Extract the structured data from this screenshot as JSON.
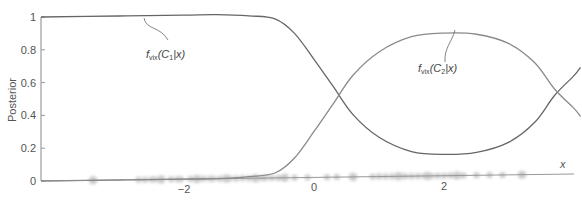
{
  "chart_data": {
    "type": "line",
    "title": "",
    "xlabel": "x",
    "ylabel": "Posterior",
    "xlim": [
      -4.2,
      4.1
    ],
    "ylim": [
      0,
      1
    ],
    "x_ticks": [
      -2,
      0,
      2
    ],
    "x_tick_labels": [
      "−2",
      "0",
      "2"
    ],
    "y_ticks": [
      0,
      0.2,
      0.4,
      0.6,
      0.8,
      1
    ],
    "y_tick_labels": [
      "0",
      "0.2",
      "0.4",
      "0.6",
      "0.8",
      "1"
    ],
    "grid": false,
    "legend": "none (inline annotations)",
    "x": [
      -4.2,
      -3.0,
      -2.0,
      -1.5,
      -1.0,
      -0.6,
      -0.3,
      0.0,
      0.3,
      0.6,
      1.0,
      1.5,
      2.0,
      2.5,
      3.0,
      3.4,
      3.7,
      4.0,
      4.1
    ],
    "series": [
      {
        "name": "f_vix(C1|x)",
        "color": "#666666",
        "values": [
          1.0,
          1.0,
          1.0,
          1.0,
          0.99,
          0.97,
          0.88,
          0.72,
          0.55,
          0.38,
          0.24,
          0.15,
          0.13,
          0.14,
          0.2,
          0.32,
          0.48,
          0.6,
          0.65
        ]
      },
      {
        "name": "f_vix(C2|x)",
        "color": "#888888",
        "values": [
          0.0,
          0.0,
          0.0,
          0.0,
          0.01,
          0.03,
          0.12,
          0.28,
          0.45,
          0.62,
          0.76,
          0.85,
          0.87,
          0.86,
          0.8,
          0.68,
          0.52,
          0.4,
          0.35
        ]
      }
    ],
    "annotations": [
      {
        "text": "f",
        "sub": "vix",
        "rest": "(C",
        "sub2": "1",
        "tail": "|x)",
        "at_x": -2.2,
        "at_y": 1.0
      },
      {
        "text": "f",
        "sub": "vix",
        "rest": "(C",
        "sub2": "2",
        "tail": "|x)",
        "at_x": 1.7,
        "at_y": 0.87
      }
    ],
    "rug": "blurred data point markers along x-axis from about -3.5 to 3.3"
  }
}
